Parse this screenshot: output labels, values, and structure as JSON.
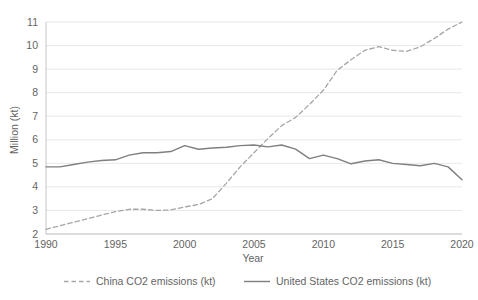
{
  "chart_data": {
    "type": "line",
    "title": "",
    "xlabel": "Year",
    "ylabel": "Million (kt)",
    "xlim": [
      1990,
      2020
    ],
    "ylim": [
      2,
      11
    ],
    "grid": true,
    "legend_position": "bottom",
    "x": [
      1990,
      1991,
      1992,
      1993,
      1994,
      1995,
      1996,
      1997,
      1998,
      1999,
      2000,
      2001,
      2002,
      2003,
      2004,
      2005,
      2006,
      2007,
      2008,
      2009,
      2010,
      2011,
      2012,
      2013,
      2014,
      2015,
      2016,
      2017,
      2018,
      2019,
      2020
    ],
    "xticks": [
      1990,
      1995,
      2000,
      2005,
      2010,
      2015,
      2020
    ],
    "xtick_labels": [
      "1990",
      "1995",
      "2000",
      "2005",
      "2010",
      "2015",
      "2020"
    ],
    "yticks": [
      2,
      3,
      4,
      5,
      6,
      7,
      8,
      9,
      10,
      11
    ],
    "ytick_labels": [
      "2",
      "3",
      "4",
      "5",
      "6",
      "7",
      "8",
      "9",
      "10",
      "11"
    ],
    "series": [
      {
        "name": "China CO2 emissions (kt)",
        "style": "dashed",
        "color": "#a6a6a6",
        "values": [
          2.2,
          2.35,
          2.5,
          2.65,
          2.8,
          2.95,
          3.05,
          3.05,
          3.0,
          3.02,
          3.15,
          3.25,
          3.5,
          4.15,
          4.85,
          5.45,
          6.05,
          6.6,
          6.95,
          7.5,
          8.1,
          8.95,
          9.4,
          9.8,
          9.95,
          9.8,
          9.75,
          9.95,
          10.3,
          10.7,
          11.0
        ]
      },
      {
        "name": "United States CO2 emissions (kt)",
        "style": "solid",
        "color": "#7f7f7f",
        "values": [
          4.85,
          4.85,
          4.95,
          5.05,
          5.12,
          5.15,
          5.35,
          5.45,
          5.45,
          5.5,
          5.75,
          5.6,
          5.65,
          5.68,
          5.75,
          5.78,
          5.7,
          5.78,
          5.6,
          5.2,
          5.35,
          5.2,
          4.98,
          5.1,
          5.15,
          5.0,
          4.95,
          4.9,
          5.0,
          4.85,
          4.3
        ]
      }
    ]
  },
  "legend": {
    "items": [
      {
        "label": "China CO2 emissions (kt)"
      },
      {
        "label": "United States CO2 emissions (kt)"
      }
    ]
  }
}
